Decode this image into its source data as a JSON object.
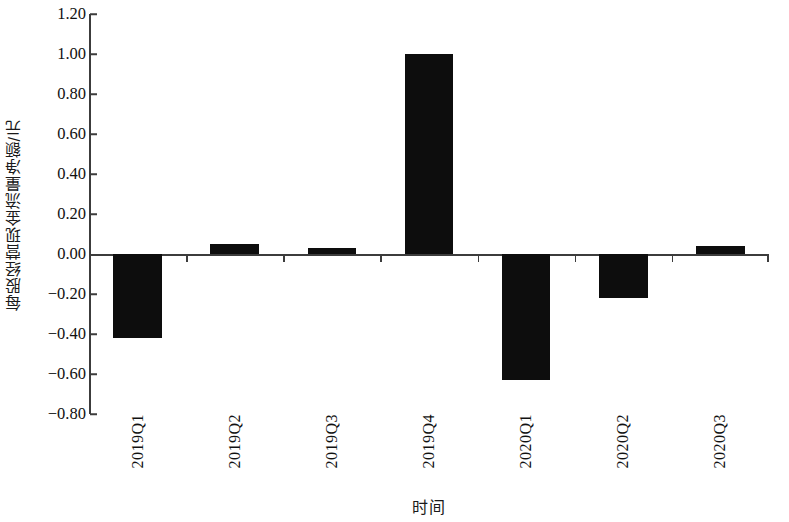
{
  "chart_data": {
    "type": "bar",
    "title": "",
    "xlabel": "时间",
    "ylabel": "每股经营现金流量净额/元",
    "categories": [
      "2019Q1",
      "2019Q2",
      "2019Q3",
      "2019Q4",
      "2020Q1",
      "2020Q2",
      "2020Q3"
    ],
    "values": [
      -0.42,
      0.05,
      0.03,
      1.0,
      -0.63,
      -0.22,
      0.04
    ],
    "series": [
      {
        "name": "每股经营现金流量净额",
        "values": [
          -0.42,
          0.05,
          0.03,
          1.0,
          -0.63,
          -0.22,
          0.04
        ]
      }
    ],
    "ylim": [
      -0.8,
      1.2
    ],
    "ytick_labels": [
      "1.20",
      "1.00",
      "0.80",
      "0.60",
      "0.40",
      "0.20",
      "0.00",
      "-0.20",
      "-0.40",
      "-0.60",
      "-0.80"
    ],
    "ytick_values": [
      1.2,
      1.0,
      0.8,
      0.6,
      0.4,
      0.2,
      0.0,
      -0.2,
      -0.4,
      -0.6,
      -0.8
    ],
    "ytick_step": 0.2,
    "grid": false,
    "legend": false,
    "legend_position": "none",
    "bar_color": "#0d0d0d",
    "axis_color": "#3c3c3c",
    "background_color": "#ffffff"
  }
}
